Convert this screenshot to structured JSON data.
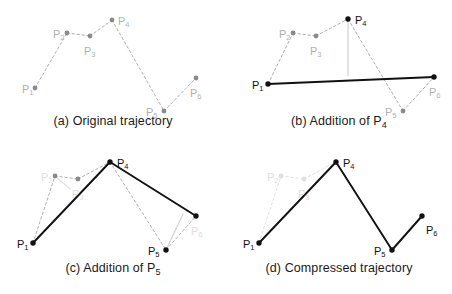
{
  "figure": {
    "colors": {
      "black": "#111111",
      "gray_dark": "#8a8a8a",
      "gray_mid": "#b0b0b0",
      "gray_light": "#d2d2d2",
      "gray_faint": "#e0e0e0",
      "background": "#ffffff"
    },
    "point_names": [
      "P1",
      "P2",
      "P3",
      "P4",
      "P5",
      "P6"
    ],
    "label_subscripts": [
      "1",
      "2",
      "3",
      "4",
      "5",
      "6"
    ],
    "label_base": "P"
  },
  "panels": [
    {
      "id": "a",
      "caption_prefix": "(a)",
      "caption_text": "Original trajectory",
      "caption_subscript": "",
      "points": [
        {
          "name": "P1",
          "sub": "1",
          "x": 35,
          "y": 88,
          "style": "gray",
          "label_x": 22,
          "label_y": 90,
          "label_style": "gray"
        },
        {
          "name": "P2",
          "sub": "2",
          "x": 67,
          "y": 33,
          "style": "gray",
          "label_x": 53,
          "label_y": 35,
          "label_style": "gray"
        },
        {
          "name": "P3",
          "sub": "3",
          "x": 90,
          "y": 36,
          "style": "gray",
          "label_x": 84,
          "label_y": 52,
          "label_style": "gray"
        },
        {
          "name": "P4",
          "sub": "4",
          "x": 112,
          "y": 20,
          "style": "gray",
          "label_x": 118,
          "label_y": 22,
          "label_style": "gray"
        },
        {
          "name": "P5",
          "sub": "5",
          "x": 164,
          "y": 111,
          "style": "gray",
          "label_x": 146,
          "label_y": 113,
          "label_style": "gray"
        },
        {
          "name": "P6",
          "sub": "6",
          "x": 196,
          "y": 78,
          "style": "gray",
          "label_x": 190,
          "label_y": 94,
          "label_style": "gray"
        }
      ],
      "segments": [
        {
          "from": "P1",
          "to": "P2",
          "style": "dashed-gray"
        },
        {
          "from": "P2",
          "to": "P3",
          "style": "dashed-gray"
        },
        {
          "from": "P3",
          "to": "P4",
          "style": "dashed-gray"
        },
        {
          "from": "P4",
          "to": "P5",
          "style": "dashed-gray"
        },
        {
          "from": "P5",
          "to": "P6",
          "style": "dashed-gray"
        }
      ],
      "helper_lines": []
    },
    {
      "id": "b",
      "caption_prefix": "(b)",
      "caption_text": "Addition of P",
      "caption_subscript": "4",
      "points": [
        {
          "name": "P1",
          "sub": "1",
          "x": 42,
          "y": 84,
          "style": "black",
          "label_x": 26,
          "label_y": 86,
          "label_style": "black"
        },
        {
          "name": "P2",
          "sub": "2",
          "x": 67,
          "y": 33,
          "style": "gray",
          "label_x": 53,
          "label_y": 35,
          "label_style": "gray"
        },
        {
          "name": "P3",
          "sub": "3",
          "x": 90,
          "y": 36,
          "style": "gray",
          "label_x": 84,
          "label_y": 52,
          "label_style": "gray"
        },
        {
          "name": "P4",
          "sub": "4",
          "x": 122,
          "y": 19,
          "style": "black",
          "label_x": 129,
          "label_y": 21,
          "label_style": "black"
        },
        {
          "name": "P5",
          "sub": "5",
          "x": 177,
          "y": 111,
          "style": "gray",
          "label_x": 159,
          "label_y": 113,
          "label_style": "gray"
        },
        {
          "name": "P6",
          "sub": "6",
          "x": 208,
          "y": 77,
          "style": "black",
          "label_x": 203,
          "label_y": 93,
          "label_style": "gray"
        }
      ],
      "segments": [
        {
          "from": "P1",
          "to": "P2",
          "style": "dashed-gray"
        },
        {
          "from": "P2",
          "to": "P3",
          "style": "dashed-gray"
        },
        {
          "from": "P3",
          "to": "P4",
          "style": "dashed-gray"
        },
        {
          "from": "P4",
          "to": "P5",
          "style": "dashed-gray"
        },
        {
          "from": "P5",
          "to": "P6",
          "style": "dashed-gray"
        },
        {
          "from": "P1",
          "to": "P6",
          "style": "solid-black"
        }
      ],
      "helper_lines": [
        {
          "name": "distance-p4-to-baseline",
          "x1": 122,
          "y1": 19,
          "x2": 122,
          "y2": 76,
          "style": "solid-gray-light"
        }
      ]
    },
    {
      "id": "c",
      "caption_prefix": "(c)",
      "caption_text": "Addition of P",
      "caption_subscript": "5",
      "points": [
        {
          "name": "P1",
          "sub": "1",
          "x": 33,
          "y": 96,
          "style": "black",
          "label_x": 17,
          "label_y": 98,
          "label_style": "black"
        },
        {
          "name": "P2",
          "sub": "2",
          "x": 55,
          "y": 29,
          "style": "gray",
          "label_x": 41,
          "label_y": 31,
          "label_style": "gray-faint"
        },
        {
          "name": "P3",
          "sub": "3",
          "x": 78,
          "y": 32,
          "style": "gray",
          "label_x": 72,
          "label_y": 48,
          "label_style": "gray-faint"
        },
        {
          "name": "P4",
          "sub": "4",
          "x": 110,
          "y": 15,
          "style": "black",
          "label_x": 117,
          "label_y": 17,
          "label_style": "black"
        },
        {
          "name": "P5",
          "sub": "5",
          "x": 166,
          "y": 103,
          "style": "black",
          "label_x": 148,
          "label_y": 105,
          "label_style": "black"
        },
        {
          "name": "P6",
          "sub": "6",
          "x": 196,
          "y": 69,
          "style": "black",
          "label_x": 191,
          "label_y": 85,
          "label_style": "gray-faint"
        }
      ],
      "segments": [
        {
          "from": "P1",
          "to": "P2",
          "style": "dashed-gray"
        },
        {
          "from": "P2",
          "to": "P3",
          "style": "dashed-gray"
        },
        {
          "from": "P3",
          "to": "P4",
          "style": "dashed-gray"
        },
        {
          "from": "P4",
          "to": "P5",
          "style": "dashed-gray"
        },
        {
          "from": "P5",
          "to": "P6",
          "style": "dashed-gray"
        },
        {
          "from": "P1",
          "to": "P4",
          "style": "solid-black"
        },
        {
          "from": "P4",
          "to": "P6",
          "style": "solid-black"
        }
      ],
      "helper_lines": [
        {
          "name": "distance-p5-to-baseline",
          "x1": 166,
          "y1": 103,
          "x2": 183,
          "y2": 67,
          "style": "solid-gray-light"
        },
        {
          "name": "distance-p2-to-baseline",
          "x1": 55,
          "y1": 29,
          "x2": 70,
          "y2": 42,
          "style": "solid-gray-faint"
        }
      ]
    },
    {
      "id": "d",
      "caption_prefix": "(d)",
      "caption_text": "Compressed trajectory",
      "caption_subscript": "",
      "points": [
        {
          "name": "P1",
          "sub": "1",
          "x": 33,
          "y": 96,
          "style": "black",
          "label_x": 17,
          "label_y": 98,
          "label_style": "black"
        },
        {
          "name": "P2",
          "sub": "2",
          "x": 55,
          "y": 29,
          "style": "gray-faint",
          "label_x": 41,
          "label_y": 31,
          "label_style": "gray-faint"
        },
        {
          "name": "P3",
          "sub": "3",
          "x": 78,
          "y": 32,
          "style": "gray-faint",
          "label_x": 72,
          "label_y": 48,
          "label_style": "gray-faint"
        },
        {
          "name": "P4",
          "sub": "4",
          "x": 110,
          "y": 15,
          "style": "black",
          "label_x": 117,
          "label_y": 17,
          "label_style": "black"
        },
        {
          "name": "P5",
          "sub": "5",
          "x": 166,
          "y": 103,
          "style": "black",
          "label_x": 148,
          "label_y": 105,
          "label_style": "black"
        },
        {
          "name": "P6",
          "sub": "6",
          "x": 196,
          "y": 69,
          "style": "black",
          "label_x": 200,
          "label_y": 84,
          "label_style": "black"
        }
      ],
      "segments": [
        {
          "from": "P1",
          "to": "P2",
          "style": "dashed-faint"
        },
        {
          "from": "P2",
          "to": "P3",
          "style": "dashed-faint"
        },
        {
          "from": "P3",
          "to": "P4",
          "style": "dashed-faint"
        },
        {
          "from": "P1",
          "to": "P4",
          "style": "solid-black"
        },
        {
          "from": "P4",
          "to": "P5",
          "style": "solid-black"
        },
        {
          "from": "P5",
          "to": "P6",
          "style": "solid-black"
        }
      ],
      "helper_lines": []
    }
  ]
}
